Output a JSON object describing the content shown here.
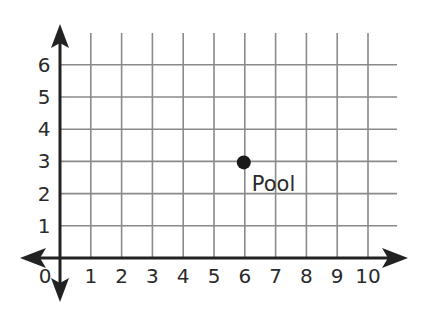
{
  "chart_data": {
    "type": "scatter",
    "title": "",
    "xlabel": "",
    "ylabel": "",
    "xlim": [
      0,
      10
    ],
    "ylim": [
      0,
      6
    ],
    "grid": true,
    "x_ticks": [
      "1",
      "2",
      "3",
      "4",
      "5",
      "6",
      "7",
      "8",
      "9",
      "10"
    ],
    "y_ticks": [
      "1",
      "2",
      "3",
      "4",
      "5",
      "6"
    ],
    "origin_label": "0",
    "points": [
      {
        "label": "Pool",
        "x": 6,
        "y": 3
      }
    ]
  },
  "colors": {
    "grid": "#8a8a8a",
    "axis": "#222222",
    "point": "#1a1a1a",
    "text": "#2a2a2a"
  }
}
